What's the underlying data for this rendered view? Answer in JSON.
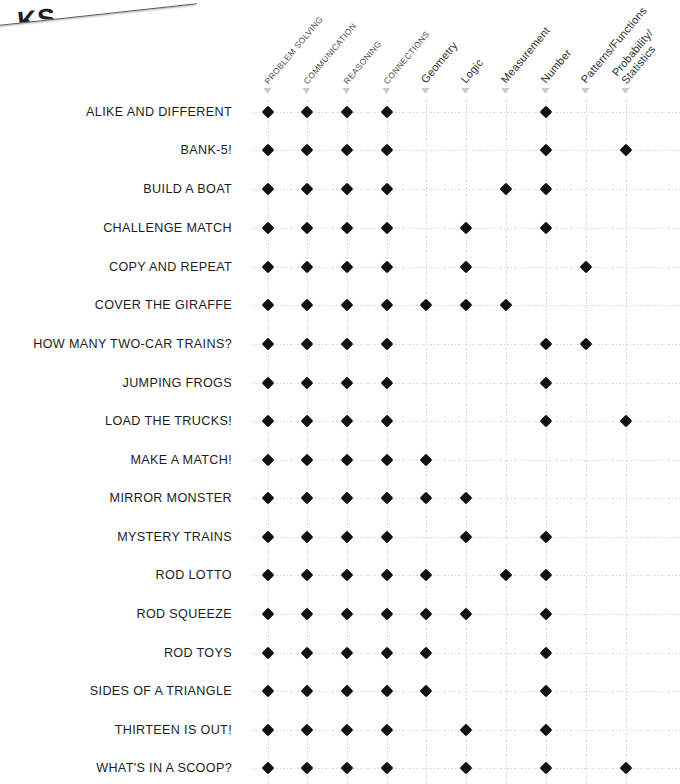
{
  "banner": {
    "clipped_text": "KS"
  },
  "columns": [
    {
      "label": "PROBLEM SOLVING",
      "style": "upper",
      "x": 268
    },
    {
      "label": "COMMUNICATION",
      "style": "upper",
      "x": 307
    },
    {
      "label": "REASONING",
      "style": "upper",
      "x": 347
    },
    {
      "label": "CONNECTIONS",
      "style": "upper",
      "x": 387
    },
    {
      "label": "Geometry",
      "style": "title",
      "x": 426
    },
    {
      "label": "Logic",
      "style": "title",
      "x": 466
    },
    {
      "label": "Measurement",
      "style": "title",
      "x": 506
    },
    {
      "label": "Number",
      "style": "title",
      "x": 546
    },
    {
      "label": "Patterns/Functions",
      "style": "title",
      "x": 586
    },
    {
      "label": "Probability/",
      "label2": "Statistics",
      "style": "title",
      "x": 626
    }
  ],
  "rows": [
    {
      "label": "ALIKE AND DIFFERENT",
      "y": 112,
      "marks": [
        1,
        1,
        1,
        1,
        0,
        0,
        0,
        1,
        0,
        0
      ]
    },
    {
      "label": "BANK-5!",
      "y": 150,
      "marks": [
        1,
        1,
        1,
        1,
        0,
        0,
        0,
        1,
        0,
        1
      ]
    },
    {
      "label": "BUILD A BOAT",
      "y": 189,
      "marks": [
        1,
        1,
        1,
        1,
        0,
        0,
        1,
        1,
        0,
        0
      ]
    },
    {
      "label": "CHALLENGE MATCH",
      "y": 228,
      "marks": [
        1,
        1,
        1,
        1,
        0,
        1,
        0,
        1,
        0,
        0
      ]
    },
    {
      "label": "COPY AND REPEAT",
      "y": 267,
      "marks": [
        1,
        1,
        1,
        1,
        0,
        1,
        0,
        0,
        1,
        0
      ]
    },
    {
      "label": "COVER THE GIRAFFE",
      "y": 305,
      "marks": [
        1,
        1,
        1,
        1,
        1,
        1,
        1,
        0,
        0,
        0
      ]
    },
    {
      "label": "HOW MANY TWO-CAR TRAINS?",
      "y": 344,
      "marks": [
        1,
        1,
        1,
        1,
        0,
        0,
        0,
        1,
        1,
        0
      ]
    },
    {
      "label": "JUMPING FROGS",
      "y": 383,
      "marks": [
        1,
        1,
        1,
        1,
        0,
        0,
        0,
        1,
        0,
        0
      ]
    },
    {
      "label": "LOAD THE TRUCKS!",
      "y": 421,
      "marks": [
        1,
        1,
        1,
        1,
        0,
        0,
        0,
        1,
        0,
        1
      ]
    },
    {
      "label": "MAKE A MATCH!",
      "y": 460,
      "marks": [
        1,
        1,
        1,
        1,
        1,
        0,
        0,
        0,
        0,
        0
      ]
    },
    {
      "label": "MIRROR MONSTER",
      "y": 498,
      "marks": [
        1,
        1,
        1,
        1,
        1,
        1,
        0,
        0,
        0,
        0
      ]
    },
    {
      "label": "MYSTERY TRAINS",
      "y": 537,
      "marks": [
        1,
        1,
        1,
        1,
        0,
        1,
        0,
        1,
        0,
        0
      ]
    },
    {
      "label": "ROD LOTTO",
      "y": 575,
      "marks": [
        1,
        1,
        1,
        1,
        1,
        0,
        1,
        1,
        0,
        0
      ]
    },
    {
      "label": "ROD SQUEEZE",
      "y": 614,
      "marks": [
        1,
        1,
        1,
        1,
        1,
        1,
        0,
        1,
        0,
        0
      ]
    },
    {
      "label": "ROD TOYS",
      "y": 653,
      "marks": [
        1,
        1,
        1,
        1,
        1,
        0,
        0,
        1,
        0,
        0
      ]
    },
    {
      "label": "SIDES OF A TRIANGLE",
      "y": 691,
      "marks": [
        1,
        1,
        1,
        1,
        1,
        0,
        0,
        1,
        0,
        0
      ]
    },
    {
      "label": "THIRTEEN IS OUT!",
      "y": 730,
      "marks": [
        1,
        1,
        1,
        1,
        0,
        1,
        0,
        1,
        0,
        0
      ]
    },
    {
      "label": "WHAT'S IN A SCOOP?",
      "y": 768,
      "marks": [
        1,
        1,
        1,
        1,
        0,
        1,
        0,
        1,
        0,
        1
      ]
    }
  ],
  "chart_data": {
    "type": "table",
    "title": "",
    "xlabel": "",
    "ylabel": "",
    "grid": true,
    "legend": "none",
    "categories": [
      "PROBLEM SOLVING",
      "COMMUNICATION",
      "REASONING",
      "CONNECTIONS",
      "Geometry",
      "Logic",
      "Measurement",
      "Number",
      "Patterns/Functions",
      "Probability/Statistics"
    ],
    "series": [
      {
        "name": "ALIKE AND DIFFERENT",
        "values": [
          1,
          1,
          1,
          1,
          0,
          0,
          0,
          1,
          0,
          0
        ]
      },
      {
        "name": "BANK-5!",
        "values": [
          1,
          1,
          1,
          1,
          0,
          0,
          0,
          1,
          0,
          1
        ]
      },
      {
        "name": "BUILD A BOAT",
        "values": [
          1,
          1,
          1,
          1,
          0,
          0,
          1,
          1,
          0,
          0
        ]
      },
      {
        "name": "CHALLENGE MATCH",
        "values": [
          1,
          1,
          1,
          1,
          0,
          1,
          0,
          1,
          0,
          0
        ]
      },
      {
        "name": "COPY AND REPEAT",
        "values": [
          1,
          1,
          1,
          1,
          0,
          1,
          0,
          0,
          1,
          0
        ]
      },
      {
        "name": "COVER THE GIRAFFE",
        "values": [
          1,
          1,
          1,
          1,
          1,
          1,
          1,
          0,
          0,
          0
        ]
      },
      {
        "name": "HOW MANY TWO-CAR TRAINS?",
        "values": [
          1,
          1,
          1,
          1,
          0,
          0,
          0,
          1,
          1,
          0
        ]
      },
      {
        "name": "JUMPING FROGS",
        "values": [
          1,
          1,
          1,
          1,
          0,
          0,
          0,
          1,
          0,
          0
        ]
      },
      {
        "name": "LOAD THE TRUCKS!",
        "values": [
          1,
          1,
          1,
          1,
          0,
          0,
          0,
          1,
          0,
          1
        ]
      },
      {
        "name": "MAKE A MATCH!",
        "values": [
          1,
          1,
          1,
          1,
          1,
          0,
          0,
          0,
          0,
          0
        ]
      },
      {
        "name": "MIRROR MONSTER",
        "values": [
          1,
          1,
          1,
          1,
          1,
          1,
          0,
          0,
          0,
          0
        ]
      },
      {
        "name": "MYSTERY TRAINS",
        "values": [
          1,
          1,
          1,
          1,
          0,
          1,
          0,
          1,
          0,
          0
        ]
      },
      {
        "name": "ROD LOTTO",
        "values": [
          1,
          1,
          1,
          1,
          1,
          0,
          1,
          1,
          0,
          0
        ]
      },
      {
        "name": "ROD SQUEEZE",
        "values": [
          1,
          1,
          1,
          1,
          1,
          1,
          0,
          1,
          0,
          0
        ]
      },
      {
        "name": "ROD TOYS",
        "values": [
          1,
          1,
          1,
          1,
          1,
          0,
          0,
          1,
          0,
          0
        ]
      },
      {
        "name": "SIDES OF A TRIANGLE",
        "values": [
          1,
          1,
          1,
          1,
          1,
          0,
          0,
          1,
          0,
          0
        ]
      },
      {
        "name": "THIRTEEN IS OUT!",
        "values": [
          1,
          1,
          1,
          1,
          0,
          1,
          0,
          1,
          0,
          0
        ]
      },
      {
        "name": "WHAT'S IN A SCOOP?",
        "values": [
          1,
          1,
          1,
          1,
          0,
          1,
          0,
          1,
          0,
          1
        ]
      }
    ],
    "marker": "filled-diamond",
    "marker_color": "#111111"
  }
}
